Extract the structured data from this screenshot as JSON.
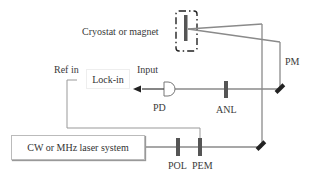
{
  "diagram": {
    "type": "optical-setup",
    "components": {
      "cryostat": {
        "label": "Cryostat or magnet"
      },
      "pm": {
        "label": "PM"
      },
      "lockin": {
        "label": "Lock-in",
        "input_label": "Input",
        "ref_label": "Ref in"
      },
      "pd": {
        "label": "PD"
      },
      "anl": {
        "label": "ANL"
      },
      "laser": {
        "label": "CW or MHz laser system"
      },
      "pol": {
        "label": "POL"
      },
      "pem": {
        "label": "PEM"
      }
    },
    "colors": {
      "beam": "#8a8a8a",
      "optic": "#555555",
      "mirror": "#222222",
      "text": "#3a3a3a"
    }
  }
}
